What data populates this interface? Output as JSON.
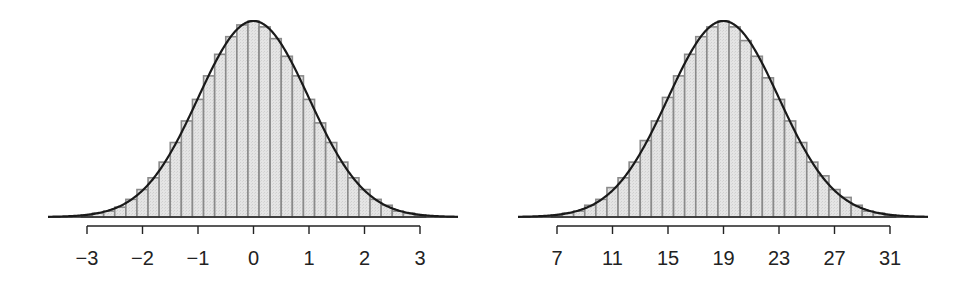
{
  "chart_data": [
    {
      "type": "bar",
      "subtype": "histogram_with_density_curve",
      "title": "",
      "xlabel": "",
      "ylabel": "",
      "distribution": "Normal(mean=0, sd=1)",
      "mean": 0,
      "sd": 1,
      "bin_width": 0.2,
      "xlim": [
        -3.6,
        3.6
      ],
      "x_ticks": [
        -3,
        -2,
        -1,
        0,
        1,
        2,
        3
      ],
      "x_tick_labels": [
        "−3",
        "−2",
        "−1",
        "0",
        "1",
        "2",
        "3"
      ],
      "grid": false,
      "legend": "none",
      "bins": {
        "centers": [
          -3.0,
          -2.8,
          -2.6,
          -2.4,
          -2.2,
          -2.0,
          -1.8,
          -1.6,
          -1.4,
          -1.2,
          -1.0,
          -0.8,
          -0.6,
          -0.4,
          -0.2,
          0.0,
          0.2,
          0.4,
          0.6,
          0.8,
          1.0,
          1.2,
          1.4,
          1.6,
          1.8,
          2.0,
          2.2,
          2.4,
          2.6,
          2.8,
          3.0
        ],
        "relative_heights": [
          0.01,
          0.02,
          0.03,
          0.05,
          0.09,
          0.14,
          0.2,
          0.28,
          0.38,
          0.49,
          0.6,
          0.72,
          0.83,
          0.92,
          0.98,
          1.0,
          0.97,
          0.91,
          0.82,
          0.72,
          0.6,
          0.48,
          0.38,
          0.28,
          0.2,
          0.14,
          0.09,
          0.06,
          0.03,
          0.02,
          0.01
        ]
      }
    },
    {
      "type": "bar",
      "subtype": "histogram_with_density_curve",
      "title": "",
      "xlabel": "",
      "ylabel": "",
      "distribution": "Normal(mean=19, sd=4)",
      "mean": 19,
      "sd": 4,
      "bin_width": 0.8,
      "xlim": [
        4.6,
        33.4
      ],
      "x_ticks": [
        7,
        11,
        15,
        19,
        23,
        27,
        31
      ],
      "x_tick_labels": [
        "7",
        "11",
        "15",
        "19",
        "23",
        "27",
        "31"
      ],
      "grid": false,
      "legend": "none",
      "bins": {
        "centers": [
          7.0,
          7.8,
          8.6,
          9.4,
          10.2,
          11.0,
          11.8,
          12.6,
          13.4,
          14.2,
          15.0,
          15.8,
          16.6,
          17.4,
          18.2,
          19.0,
          19.8,
          20.6,
          21.4,
          22.2,
          23.0,
          23.8,
          24.6,
          25.4,
          26.2,
          27.0,
          27.8,
          28.6,
          29.4,
          30.2,
          31.0
        ],
        "relative_heights": [
          0.01,
          0.02,
          0.03,
          0.06,
          0.09,
          0.15,
          0.2,
          0.28,
          0.39,
          0.49,
          0.61,
          0.72,
          0.83,
          0.92,
          0.97,
          1.0,
          0.97,
          0.9,
          0.82,
          0.71,
          0.6,
          0.49,
          0.38,
          0.28,
          0.21,
          0.14,
          0.1,
          0.06,
          0.03,
          0.02,
          0.01
        ]
      }
    }
  ],
  "panels": [
    {
      "name": "left-histogram"
    },
    {
      "name": "right-histogram"
    }
  ]
}
